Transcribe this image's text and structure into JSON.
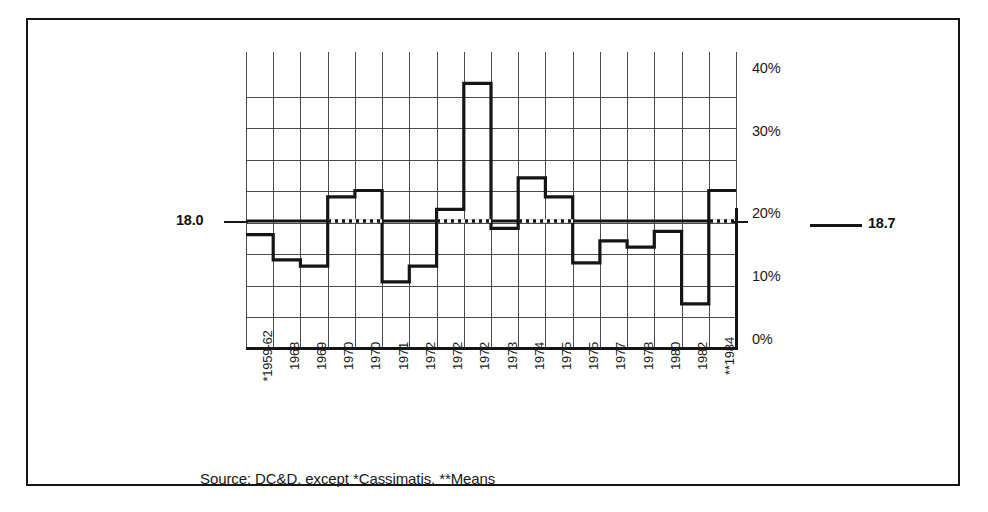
{
  "chart_data": {
    "type": "bar",
    "title": "",
    "subtitle": "",
    "xlabel": "",
    "ylabel": "",
    "ylim": [
      0,
      45
    ],
    "grid": true,
    "grid_interval": 5,
    "legend_position": "none",
    "categories": [
      "*1959-62",
      "1968",
      "1969",
      "1970",
      "1970",
      "1971",
      "1972",
      "1972",
      "1972",
      "1973",
      "1974",
      "1975",
      "1975",
      "1977",
      "1978",
      "1980",
      "1982",
      "**1984"
    ],
    "values": [
      18.0,
      14.0,
      13.0,
      24.0,
      25.0,
      10.5,
      13.0,
      22.0,
      42.0,
      19.0,
      27.0,
      24.0,
      13.5,
      17.0,
      16.0,
      18.5,
      7.0,
      25.0
    ],
    "ytick_labels": [
      "40%",
      "30%",
      "20%",
      "10%",
      "0%"
    ],
    "ytick_values": [
      40,
      30,
      20,
      10,
      0
    ],
    "annotations": {
      "mean_left_label": "18.0",
      "mean_right_label": "18.7",
      "mean_left_value": 18.0,
      "mean_right_value": 18.7,
      "reference_line_style": "solid-with-dotted-overlay"
    },
    "source_note": "Source: DC&D, except *Cassimatis, **Means"
  },
  "colors": {
    "ink": "#151515",
    "grid": "#4a4a4a",
    "background": "#ffffff"
  }
}
